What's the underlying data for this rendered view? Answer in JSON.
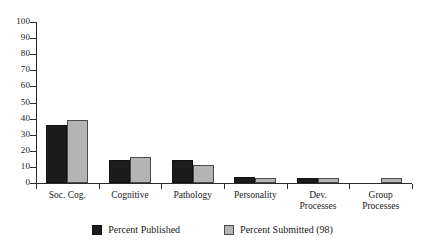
{
  "chart_data": {
    "type": "bar",
    "title": "",
    "subtitle": "",
    "xlabel": "",
    "ylabel": "",
    "ylim": [
      0,
      100
    ],
    "yticks": [
      0,
      10,
      20,
      30,
      40,
      50,
      60,
      70,
      80,
      90,
      100
    ],
    "grid": false,
    "legend_position": "bottom",
    "categories": [
      "Soc. Cog.",
      "Cognitive",
      "Pathology",
      "Personality",
      "Dev. Processes",
      "Group Processes"
    ],
    "category_lines": [
      [
        "Soc. Cog."
      ],
      [
        "Cognitive"
      ],
      [
        "Pathology"
      ],
      [
        "Personality"
      ],
      [
        "Dev.",
        "Processes"
      ],
      [
        "Group",
        "Processes"
      ]
    ],
    "series": [
      {
        "name": "Percent Published",
        "color": "#1c1c1c",
        "values": [
          36,
          14,
          14,
          4,
          3,
          0
        ]
      },
      {
        "name": "Percent Submitted (98)",
        "color": "#b4b4b4",
        "values": [
          39,
          16,
          11,
          3,
          3,
          3
        ]
      }
    ]
  },
  "legend": {
    "items": [
      {
        "label": "Percent Published",
        "swatch": "published"
      },
      {
        "label": "Percent Submitted (98)",
        "swatch": "submitted"
      }
    ]
  }
}
